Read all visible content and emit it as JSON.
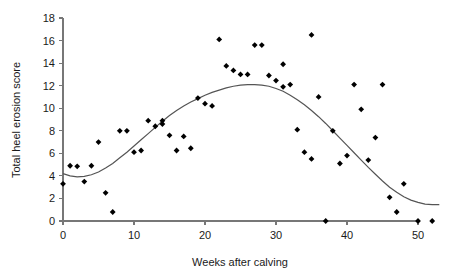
{
  "chart_data": {
    "type": "scatter",
    "title": "",
    "xlabel": "Weeks after calving",
    "ylabel": "Total heel erosion score",
    "xlim": [
      0,
      53
    ],
    "ylim": [
      0,
      18
    ],
    "xticks": [
      0,
      10,
      20,
      30,
      40,
      50
    ],
    "yticks": [
      0,
      2,
      4,
      6,
      8,
      10,
      12,
      14,
      16,
      18
    ],
    "grid": false,
    "legend": null,
    "point_marker": "diamond",
    "point_color": "#000000",
    "curve_color": "#555555",
    "series": [
      {
        "name": "Observed heel erosion scores",
        "type": "scatter",
        "points": [
          [
            0,
            3.3
          ],
          [
            1,
            4.9
          ],
          [
            2,
            4.85
          ],
          [
            3,
            3.5
          ],
          [
            4,
            4.9
          ],
          [
            5,
            7.0
          ],
          [
            6,
            2.5
          ],
          [
            7,
            0.8
          ],
          [
            8,
            8.0
          ],
          [
            9,
            8.0
          ],
          [
            10,
            6.1
          ],
          [
            11,
            6.25
          ],
          [
            12,
            8.9
          ],
          [
            13,
            8.4
          ],
          [
            14,
            8.6
          ],
          [
            14,
            8.9
          ],
          [
            15,
            7.6
          ],
          [
            16,
            6.25
          ],
          [
            17,
            7.5
          ],
          [
            18,
            6.45
          ],
          [
            19,
            10.9
          ],
          [
            20,
            10.4
          ],
          [
            21,
            10.2
          ],
          [
            22,
            16.1
          ],
          [
            23,
            13.75
          ],
          [
            24,
            13.35
          ],
          [
            25,
            13.0
          ],
          [
            26,
            13.0
          ],
          [
            27,
            15.6
          ],
          [
            28,
            15.6
          ],
          [
            29,
            12.9
          ],
          [
            30,
            12.45
          ],
          [
            31,
            13.9
          ],
          [
            31,
            11.9
          ],
          [
            32,
            12.1
          ],
          [
            33,
            8.1
          ],
          [
            34,
            6.1
          ],
          [
            35,
            16.5
          ],
          [
            35,
            5.5
          ],
          [
            36,
            11.0
          ],
          [
            37,
            0.0
          ],
          [
            38,
            8.0
          ],
          [
            39,
            5.1
          ],
          [
            40,
            5.8
          ],
          [
            41,
            12.1
          ],
          [
            42,
            9.9
          ],
          [
            43,
            5.4
          ],
          [
            44,
            7.4
          ],
          [
            45,
            12.1
          ],
          [
            46,
            2.1
          ],
          [
            47,
            0.8
          ],
          [
            48,
            3.3
          ],
          [
            50,
            0.0
          ],
          [
            52,
            0.0
          ]
        ]
      },
      {
        "name": "Fitted smooth curve",
        "type": "line",
        "points": [
          [
            0,
            4.2
          ],
          [
            1,
            4.0
          ],
          [
            2,
            3.92
          ],
          [
            3,
            3.95
          ],
          [
            4,
            4.1
          ],
          [
            5,
            4.35
          ],
          [
            6,
            4.7
          ],
          [
            7,
            5.1
          ],
          [
            8,
            5.6
          ],
          [
            9,
            6.1
          ],
          [
            10,
            6.65
          ],
          [
            11,
            7.2
          ],
          [
            12,
            7.75
          ],
          [
            13,
            8.3
          ],
          [
            14,
            8.85
          ],
          [
            15,
            9.35
          ],
          [
            16,
            9.8
          ],
          [
            17,
            10.2
          ],
          [
            18,
            10.55
          ],
          [
            19,
            10.85
          ],
          [
            20,
            11.15
          ],
          [
            21,
            11.4
          ],
          [
            22,
            11.6
          ],
          [
            23,
            11.8
          ],
          [
            24,
            11.95
          ],
          [
            25,
            12.05
          ],
          [
            26,
            12.1
          ],
          [
            27,
            12.1
          ],
          [
            28,
            12.05
          ],
          [
            29,
            11.95
          ],
          [
            30,
            11.75
          ],
          [
            31,
            11.5
          ],
          [
            32,
            11.15
          ],
          [
            33,
            10.75
          ],
          [
            34,
            10.3
          ],
          [
            35,
            9.8
          ],
          [
            36,
            9.25
          ],
          [
            37,
            8.65
          ],
          [
            38,
            8.0
          ],
          [
            39,
            7.35
          ],
          [
            40,
            6.7
          ],
          [
            41,
            6.05
          ],
          [
            42,
            5.4
          ],
          [
            43,
            4.75
          ],
          [
            44,
            4.15
          ],
          [
            45,
            3.55
          ],
          [
            46,
            3.0
          ],
          [
            47,
            2.55
          ],
          [
            48,
            2.15
          ],
          [
            49,
            1.85
          ],
          [
            50,
            1.65
          ],
          [
            51,
            1.5
          ],
          [
            52,
            1.45
          ],
          [
            53,
            1.45
          ]
        ]
      }
    ]
  }
}
